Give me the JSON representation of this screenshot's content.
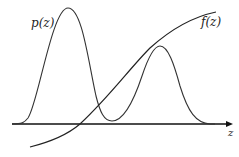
{
  "diagram": {
    "labels": {
      "density": "p(z)",
      "function": "f(z)",
      "axis": "z"
    },
    "colors": {
      "stroke": "#333333",
      "axis": "#111111",
      "background": "#ffffff"
    },
    "curves": [
      {
        "name": "p(z)",
        "description": "bimodal density: tall narrow peak on left, smaller peak on right"
      },
      {
        "name": "f(z)",
        "description": "monotonically increasing concave function"
      }
    ]
  }
}
